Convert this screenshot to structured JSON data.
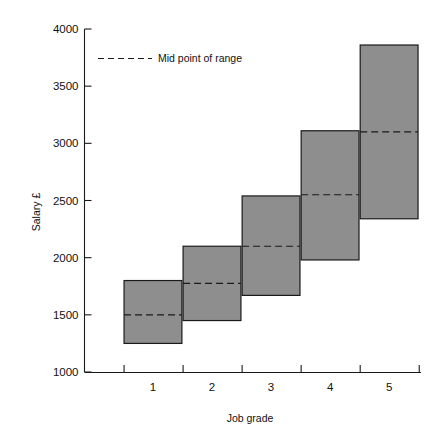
{
  "chart_data": {
    "type": "bar",
    "title": "",
    "subtitle": "",
    "xlabel": "Job grade",
    "ylabel": "Salary £",
    "categories": [
      "1",
      "2",
      "3",
      "4",
      "5"
    ],
    "xtick_labels": [
      "1",
      "2",
      "3",
      "4",
      "5"
    ],
    "ytick_labels": [
      "1000",
      "1500",
      "2000",
      "2500",
      "3000",
      "3500",
      "4000"
    ],
    "ytick_values": [
      1000,
      1500,
      2000,
      2500,
      3000,
      3500,
      4000
    ],
    "ylim": [
      1000,
      4000
    ],
    "xlim": [
      0.5,
      5.5
    ],
    "grid": false,
    "legend_position": "top-left-inside",
    "legend": [
      {
        "label": "Mid point of range",
        "style": "dashed-line"
      }
    ],
    "series": [
      {
        "name": "Salary range",
        "kind": "range-bars",
        "fill_color": "#8e8e8e",
        "edge_color": "#1a1a1a",
        "ranges": [
          {
            "grade": "1",
            "min": 1250,
            "max": 1800,
            "mid": 1500
          },
          {
            "grade": "2",
            "min": 1450,
            "max": 2100,
            "mid": 1775
          },
          {
            "grade": "3",
            "min": 1670,
            "max": 2540,
            "mid": 2100
          },
          {
            "grade": "4",
            "min": 1980,
            "max": 3110,
            "mid": 2550
          },
          {
            "grade": "5",
            "min": 2340,
            "max": 3860,
            "mid": 3100
          }
        ]
      }
    ],
    "colors": {
      "bar_fill": "#8e8e8e",
      "bar_edge": "#1a1a1a",
      "axis": "#1a1a1a",
      "background": "#ffffff"
    }
  }
}
